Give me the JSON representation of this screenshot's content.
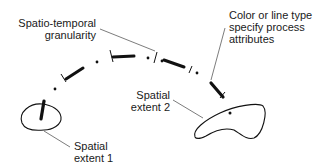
{
  "labels": {
    "granularity": "Spatio-temporal\ngranularity",
    "attributes": "Color or line type\nspecify process\nattributes",
    "extent1": "Spatial\nextent 1",
    "extent2": "Spatial\nextent 2"
  },
  "colors": {
    "stroke": "#111111",
    "leader": "#444444",
    "background": "#ffffff"
  }
}
